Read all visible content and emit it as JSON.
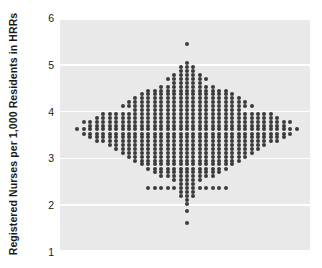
{
  "axis": {
    "ylabel": "Registered Nurses per 1,000 Residents in HRRs",
    "ticks": [
      "6",
      "5",
      "4",
      "3",
      "2",
      "1"
    ]
  },
  "chart_data": {
    "type": "scatter",
    "plot_style": "stacked-dot-histogram",
    "title": "",
    "xlabel": "",
    "ylabel": "Registered Nurses per 1,000 Residents in HRRs",
    "ylim": [
      1,
      6
    ],
    "yticks": [
      1,
      2,
      3,
      4,
      5,
      6
    ],
    "grid": "horizontal-white-gridlines",
    "legend": "none",
    "dot_color": "#3b3b3b",
    "panel_color": "#e9e9e9",
    "bin_width": 0.0833,
    "note": "Each dot is one Hospital Referral Region (HRR); dots are stacked symmetrically about the bin center.",
    "bins": [
      {
        "value": 5.45,
        "count": 1
      },
      {
        "value": 5.03,
        "count": 1
      },
      {
        "value": 4.95,
        "count": 3
      },
      {
        "value": 4.87,
        "count": 3
      },
      {
        "value": 4.78,
        "count": 5
      },
      {
        "value": 4.7,
        "count": 7
      },
      {
        "value": 4.62,
        "count": 5
      },
      {
        "value": 4.53,
        "count": 9
      },
      {
        "value": 4.45,
        "count": 13
      },
      {
        "value": 4.37,
        "count": 15
      },
      {
        "value": 4.28,
        "count": 17
      },
      {
        "value": 4.2,
        "count": 19
      },
      {
        "value": 4.12,
        "count": 21
      },
      {
        "value": 4.03,
        "count": 17
      },
      {
        "value": 3.95,
        "count": 27
      },
      {
        "value": 3.87,
        "count": 29
      },
      {
        "value": 3.78,
        "count": 33
      },
      {
        "value": 3.7,
        "count": 31
      },
      {
        "value": 3.62,
        "count": 35
      },
      {
        "value": 3.53,
        "count": 33
      },
      {
        "value": 3.45,
        "count": 31
      },
      {
        "value": 3.37,
        "count": 29
      },
      {
        "value": 3.28,
        "count": 25
      },
      {
        "value": 3.2,
        "count": 23
      },
      {
        "value": 3.12,
        "count": 21
      },
      {
        "value": 3.03,
        "count": 19
      },
      {
        "value": 2.95,
        "count": 17
      },
      {
        "value": 2.87,
        "count": 15
      },
      {
        "value": 2.78,
        "count": 13
      },
      {
        "value": 2.7,
        "count": 11
      },
      {
        "value": 2.62,
        "count": 9
      },
      {
        "value": 2.53,
        "count": 5
      },
      {
        "value": 2.45,
        "count": 3
      },
      {
        "value": 2.37,
        "count": 13
      },
      {
        "value": 2.28,
        "count": 3
      },
      {
        "value": 2.2,
        "count": 3
      },
      {
        "value": 2.12,
        "count": 1
      },
      {
        "value": 2.03,
        "count": 1
      },
      {
        "value": 1.87,
        "count": 1
      },
      {
        "value": 1.62,
        "count": 1
      }
    ]
  }
}
